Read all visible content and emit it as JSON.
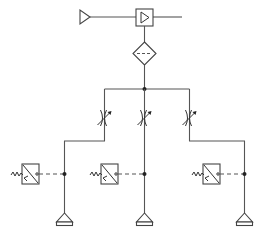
{
  "diagram": {
    "title": "",
    "type": "pneumatic-schematic",
    "colors": {
      "line": "#555555",
      "background": "#ffffff",
      "junction": "#222222"
    },
    "components": [
      {
        "id": "pressure-source",
        "symbol": "source-triangle",
        "label": ""
      },
      {
        "id": "check-valve-box",
        "symbol": "valve-with-triangle",
        "label": ""
      },
      {
        "id": "filter",
        "symbol": "filter-diamond",
        "label": ""
      },
      {
        "id": "throttle-left",
        "symbol": "adjustable-throttle",
        "label": ""
      },
      {
        "id": "throttle-center",
        "symbol": "adjustable-throttle",
        "label": ""
      },
      {
        "id": "throttle-right",
        "symbol": "adjustable-throttle",
        "label": ""
      },
      {
        "id": "sensor-left",
        "symbol": "transducer-box",
        "label": ""
      },
      {
        "id": "sensor-center",
        "symbol": "transducer-box",
        "label": ""
      },
      {
        "id": "sensor-right",
        "symbol": "transducer-box",
        "label": ""
      },
      {
        "id": "outlet-left",
        "symbol": "exhaust-triangle",
        "label": ""
      },
      {
        "id": "outlet-center",
        "symbol": "exhaust-triangle",
        "label": ""
      },
      {
        "id": "outlet-right",
        "symbol": "exhaust-triangle",
        "label": ""
      }
    ],
    "branch_count": 3
  }
}
